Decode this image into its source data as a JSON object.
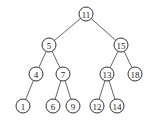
{
  "diagram": {
    "type": "binary-search-tree",
    "radius": 7,
    "nodes": [
      {
        "id": "n11",
        "label": "11",
        "x": 86,
        "y": 14
      },
      {
        "id": "n5",
        "label": "5",
        "x": 49,
        "y": 45
      },
      {
        "id": "n15",
        "label": "15",
        "x": 121,
        "y": 45
      },
      {
        "id": "n4",
        "label": "4",
        "x": 36,
        "y": 74
      },
      {
        "id": "n7",
        "label": "7",
        "x": 63,
        "y": 74
      },
      {
        "id": "n13",
        "label": "13",
        "x": 107,
        "y": 74
      },
      {
        "id": "n18",
        "label": "18",
        "x": 135,
        "y": 74
      },
      {
        "id": "n1",
        "label": "1",
        "x": 23,
        "y": 106
      },
      {
        "id": "n6",
        "label": "6",
        "x": 53,
        "y": 106
      },
      {
        "id": "n9",
        "label": "9",
        "x": 73,
        "y": 106
      },
      {
        "id": "n12",
        "label": "12",
        "x": 97,
        "y": 106
      },
      {
        "id": "n14",
        "label": "14",
        "x": 117,
        "y": 106
      }
    ],
    "edges": [
      [
        "n11",
        "n5"
      ],
      [
        "n11",
        "n15"
      ],
      [
        "n5",
        "n4"
      ],
      [
        "n5",
        "n7"
      ],
      [
        "n15",
        "n13"
      ],
      [
        "n15",
        "n18"
      ],
      [
        "n4",
        "n1"
      ],
      [
        "n7",
        "n6"
      ],
      [
        "n7",
        "n9"
      ],
      [
        "n13",
        "n12"
      ],
      [
        "n13",
        "n14"
      ]
    ]
  }
}
